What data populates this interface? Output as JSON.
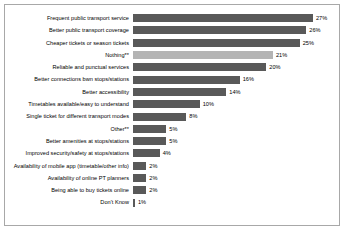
{
  "chart_data": {
    "type": "bar",
    "orientation": "horizontal",
    "title": "",
    "subtitle": "",
    "xlabel": "",
    "ylabel": "",
    "xlim": [
      0,
      27
    ],
    "grid": false,
    "legend": false,
    "value_suffix": "%",
    "colors": {
      "bar_default": "#595959",
      "bar_highlight": "#b4b4b4",
      "frame_border": "#a8a8a8",
      "background": "#ffffff",
      "text": "#000000"
    },
    "categories": [
      "Frequent public transport service",
      "Better public transport coverage",
      "Cheaper tickets or season tickets",
      "Nothing**",
      "Reliable and punctual services",
      "Better connections bwn stops/stations",
      "Better accessibility",
      "Timetables available/easy to understand",
      "Single ticket for different transport modes",
      "Other**",
      "Better amenities at stops/stations",
      "Improved security/safety at stops/stations",
      "Availability of mobile app (timetable/other info)",
      "Availability of online PT planners",
      "Being able to buy tickets online",
      "Don't Know"
    ],
    "values": [
      27,
      26,
      25,
      21,
      20,
      16,
      14,
      10,
      8,
      5,
      5,
      4,
      2,
      2,
      2,
      1
    ],
    "value_labels": [
      "27%",
      "26%",
      "25%",
      "21%",
      "20%",
      "16%",
      "14%",
      "10%",
      "8%",
      "5%",
      "5%",
      "4%",
      "2%",
      "2%",
      "2%",
      "1%"
    ],
    "highlight_indices": [
      3
    ]
  }
}
